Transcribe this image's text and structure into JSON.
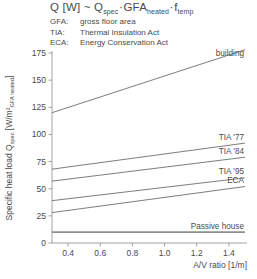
{
  "header": {
    "equation": {
      "lhs": "Q [W] ~ Q",
      "lhs_sub": "spec",
      "mid": "GFA",
      "mid_sub": "heated",
      "rhs": "f",
      "rhs_sub": "temp",
      "dot": "·"
    },
    "abbreviations": [
      {
        "key": "GFA:",
        "value": "gross floor area"
      },
      {
        "key": "TIA:",
        "value": "Thermal Insulation Act"
      },
      {
        "key": "ECA:",
        "value": "Energy Conservation Act"
      }
    ]
  },
  "chart_data": {
    "type": "line",
    "title": "",
    "xlabel": "A/V ratio [1/m]",
    "ylabel_main": "Specific heat load Q",
    "ylabel_sub": "spec",
    "ylabel_units": " [W/m²",
    "ylabel_units_sub": "GFA heated",
    "ylabel_units_close": "]",
    "xlim": [
      0.3,
      1.5
    ],
    "ylim": [
      0,
      175
    ],
    "xticks": [
      0.4,
      0.6,
      0.8,
      1.0,
      1.2,
      1.4
    ],
    "xtick_labels": [
      "0.4",
      "0.6",
      "0.8",
      "1.0",
      "1.2",
      "1.4"
    ],
    "yticks": [
      0,
      25,
      50,
      75,
      100,
      125,
      150,
      175
    ],
    "ytick_labels": [
      "0",
      "25",
      "50",
      "75",
      "100",
      "125",
      "150",
      "175"
    ],
    "grid": false,
    "legend_position": "inline-right",
    "series": [
      {
        "name": "Old building",
        "label": "Old building",
        "label_lines": [
          "Old",
          "building"
        ],
        "x": [
          0.3,
          1.5
        ],
        "values": [
          120,
          178
        ],
        "thick": false
      },
      {
        "name": "TIA '77",
        "label": "TIA '77",
        "label_lines": [
          "TIA '77"
        ],
        "x": [
          0.3,
          1.5
        ],
        "values": [
          68,
          92
        ],
        "thick": false
      },
      {
        "name": "TIA '84",
        "label": "TIA '84",
        "label_lines": [
          "TIA '84"
        ],
        "x": [
          0.3,
          1.5
        ],
        "values": [
          57,
          79
        ],
        "thick": false
      },
      {
        "name": "TIA '95",
        "label": "TIA '95",
        "label_lines": [
          "TIA '95"
        ],
        "x": [
          0.3,
          1.5
        ],
        "values": [
          39,
          60
        ],
        "thick": false
      },
      {
        "name": "ECA",
        "label": "ECA",
        "label_lines": [
          "ECA"
        ],
        "x": [
          0.3,
          1.5
        ],
        "values": [
          28,
          52
        ],
        "thick": false
      },
      {
        "name": "Passive house",
        "label": "Passive house",
        "label_lines": [
          "Passive house"
        ],
        "x": [
          0.3,
          1.5
        ],
        "values": [
          10,
          10
        ],
        "thick": true
      }
    ]
  }
}
